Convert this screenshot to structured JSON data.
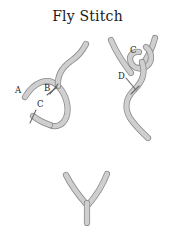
{
  "page": {
    "title": "Fly Stitch",
    "background_color": "#ffffff"
  },
  "colors": {
    "thread_fill": "#cfcfcf",
    "thread_outline": "#8c8c8c",
    "needle": "#5d5d5d",
    "label_text": "#1a1a1a"
  },
  "figures": [
    {
      "name": "step-1-loop-with-needle",
      "labels": [
        {
          "text": "A",
          "x": 19,
          "y": 58
        },
        {
          "text": "B",
          "x": 48,
          "y": 56
        },
        {
          "text": "C",
          "x": 41,
          "y": 72
        }
      ]
    },
    {
      "name": "step-2-knot-pull-through",
      "labels": [
        {
          "text": "C",
          "x": 35,
          "y": 18
        },
        {
          "text": "D",
          "x": 24,
          "y": 44
        }
      ]
    },
    {
      "name": "step-3-finished-fly-stitch",
      "labels": []
    }
  ]
}
